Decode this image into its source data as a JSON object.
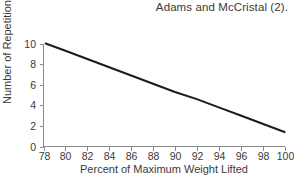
{
  "figure": {
    "caption": "Adams and McCristal (2).",
    "background_color": "#ffffff",
    "axis_color": "#8a8a8a",
    "line_color": "#1d1d1d"
  },
  "chart_data": {
    "type": "line",
    "title": "",
    "subtitle": "",
    "xlabel": "Percent of Maximum Weight Lifted",
    "ylabel": "Number of Repetitions",
    "xlim": [
      78,
      100
    ],
    "ylim": [
      0,
      10
    ],
    "xticks": [
      78,
      80,
      82,
      84,
      86,
      88,
      90,
      92,
      94,
      96,
      98,
      100
    ],
    "yticks": [
      0,
      2,
      4,
      6,
      8,
      10
    ],
    "xtick_labels": [
      "78",
      "80",
      "82",
      "84",
      "86",
      "88",
      "90",
      "92",
      "94",
      "96",
      "98",
      "100"
    ],
    "ytick_labels": [
      "0",
      "2",
      "4",
      "6",
      "8",
      "10"
    ],
    "grid": false,
    "legend": null,
    "series": [
      {
        "name": "Repetitions",
        "x": [
          78.2,
          100
        ],
        "y": [
          10.0,
          1.4
        ],
        "points": [
          {
            "x": 78.2,
            "y": 10.0
          },
          {
            "x": 80,
            "y": 9.3
          },
          {
            "x": 82,
            "y": 8.5
          },
          {
            "x": 84,
            "y": 7.7
          },
          {
            "x": 86,
            "y": 6.9
          },
          {
            "x": 88,
            "y": 6.1
          },
          {
            "x": 90,
            "y": 5.3
          },
          {
            "x": 92,
            "y": 4.6
          },
          {
            "x": 94,
            "y": 3.8
          },
          {
            "x": 96,
            "y": 3.0
          },
          {
            "x": 98,
            "y": 2.2
          },
          {
            "x": 100,
            "y": 1.4
          }
        ]
      }
    ],
    "annotations": [
      "Adams and McCristal (2)."
    ]
  }
}
